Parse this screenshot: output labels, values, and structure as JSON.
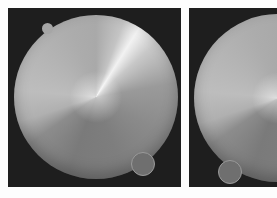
{
  "figure": {
    "background_color": "#fdfdfd",
    "panel_background_color": "#1e1e1e",
    "panels": [
      {
        "id": "left",
        "description": "grayscale disc with conic sheen, small notch tab at upper-left, outlined small circle at lower-right",
        "disc": {
          "center_x": 96,
          "center_y": 97,
          "radius": 82
        },
        "notch": {
          "center_x": 47,
          "center_y": 28,
          "radius": 5
        },
        "marker": {
          "center_x": 143,
          "center_y": 164,
          "radius": 12
        }
      },
      {
        "id": "right",
        "description": "grayscale disc (cropped at image edge) with conic sheen, outlined small circle at lower-left",
        "disc": {
          "center_x": 278,
          "center_y": 98,
          "radius": 84
        },
        "marker": {
          "center_x": 230,
          "center_y": 172,
          "radius": 12
        }
      }
    ]
  }
}
